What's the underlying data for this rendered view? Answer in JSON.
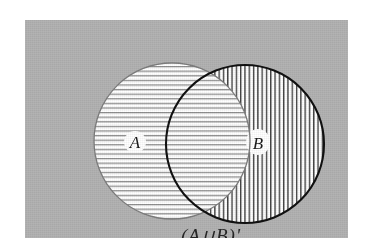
{
  "figure": {
    "type": "venn-diagram",
    "caption": "(A∪B)'",
    "caption_plain": "(A U B)'",
    "background_color": "#b3b3b3",
    "page_color": "#ffffff",
    "sets": [
      {
        "id": "A",
        "label": "A",
        "hatch": "horizontal",
        "hatch_color": "#8c8c8c",
        "outline_color": "#7d7d7d",
        "outline_width": 1.3,
        "fill_color": "#ffffff",
        "center_x": 147,
        "center_y": 121,
        "radius": 78,
        "label_x": 110,
        "label_y": 128
      },
      {
        "id": "B",
        "label": "B",
        "hatch": "vertical",
        "hatch_color": "#3c3c3c",
        "outline_color": "#111111",
        "outline_width": 2.1,
        "fill_color": "#ffffff",
        "center_x": 220,
        "center_y": 124,
        "radius": 79,
        "label_x": 232,
        "label_y": 128
      }
    ],
    "intersection": {
      "label": "A ∩ B",
      "hatch": "cross",
      "shaded": true
    },
    "caption_x": 186,
    "caption_y": 222,
    "label_font_size": 17,
    "caption_font_size": 19
  }
}
